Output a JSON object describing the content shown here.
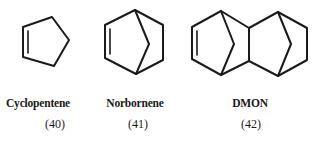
{
  "figure": {
    "compounds": [
      {
        "name": "Cyclopentene",
        "number": "(40)",
        "structure": "cyclopentene-ring"
      },
      {
        "name": "Norbornene",
        "number": "(41)",
        "structure": "norbornene-bicyclic"
      },
      {
        "name": "DMON",
        "number": "(42)",
        "structure": "dimethanooctahydronaphthalene-tricyclic"
      }
    ],
    "colors": {
      "bond": "#1a1a1a",
      "background": "#ffffff"
    }
  }
}
